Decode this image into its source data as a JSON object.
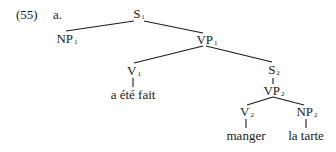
{
  "example": {
    "number": "(55)",
    "sub_label": "a."
  },
  "tree": {
    "nodes": [
      {
        "id": "S1",
        "cat": "S",
        "index": "1",
        "x": 139,
        "y": 8
      },
      {
        "id": "NP1",
        "cat": "NP",
        "index": "1",
        "x": 66,
        "y": 32
      },
      {
        "id": "VP1",
        "cat": "VP",
        "index": "1",
        "x": 206,
        "y": 34
      },
      {
        "id": "V1",
        "cat": "V",
        "index": "1",
        "x": 133,
        "y": 64
      },
      {
        "id": "S2",
        "cat": "S",
        "index": "2",
        "x": 273,
        "y": 64
      },
      {
        "id": "VP2",
        "cat": "VP",
        "index": "2",
        "x": 273,
        "y": 84
      },
      {
        "id": "V2",
        "cat": "V",
        "index": "2",
        "x": 246,
        "y": 105
      },
      {
        "id": "NP2",
        "cat": "NP",
        "index": "2",
        "x": 306,
        "y": 105
      }
    ],
    "leaves": [
      {
        "id": "leaf-V1",
        "text": "a été fait",
        "x": 133,
        "y": 88
      },
      {
        "id": "leaf-V2",
        "text": "manger",
        "x": 246,
        "y": 129
      },
      {
        "id": "leaf-NP2",
        "text": "la tarte",
        "x": 306,
        "y": 129
      }
    ],
    "edges": [
      [
        "S1",
        "NP1"
      ],
      [
        "S1",
        "VP1"
      ],
      [
        "VP1",
        "V1"
      ],
      [
        "VP1",
        "S2"
      ],
      [
        "S2",
        "VP2"
      ],
      [
        "VP2",
        "V2"
      ],
      [
        "VP2",
        "NP2"
      ],
      [
        "V1",
        "leaf-V1"
      ],
      [
        "V2",
        "leaf-V2"
      ],
      [
        "NP2",
        "leaf-NP2"
      ]
    ]
  }
}
